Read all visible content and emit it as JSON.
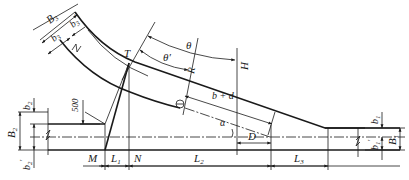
{
  "figure": {
    "type": "road intersection / ramp widening geometry drawing",
    "labels": {
      "B3": "B",
      "B3_sub": "3",
      "b3": "b",
      "b3_sub": "3",
      "b3p": "b",
      "b3p_sub": "3",
      "b3p_prime": "′",
      "T": "T",
      "theta": "θ",
      "theta_prime": "θ′",
      "R": "R",
      "H": "H",
      "b_plus_d": "b + d",
      "alpha": "α",
      "D": "D",
      "dim_500": "500",
      "b2": "b",
      "b2_sub": "2",
      "B2": "B",
      "B2_sub": "2",
      "b2p": "b",
      "b2p_sub": "2",
      "b2p_prime": "′",
      "M": "M",
      "L1": "L",
      "L1_sub": "1",
      "N": "N",
      "L2": "L",
      "L2_sub": "2",
      "L3": "L",
      "L3_sub": "3",
      "b1": "b",
      "b1_sub": "1",
      "B1": "B",
      "B1_sub": "1",
      "b1p": "b",
      "b1p_sub": "1",
      "b1p_prime": "′"
    },
    "colors": {
      "line": "#1a1a1a",
      "background": "#ffffff"
    }
  }
}
